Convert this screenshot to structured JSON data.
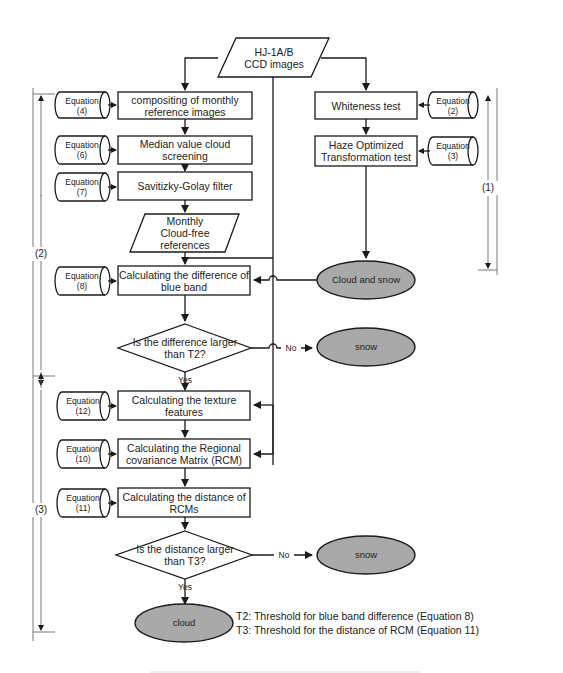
{
  "diagram": {
    "input": {
      "line1": "HJ-1A/B",
      "line2": "CCD images"
    },
    "left_steps": [
      {
        "label": "compositing of monthly reference images",
        "equation": "Equation",
        "eq_num": "(4)"
      },
      {
        "label": "Median value cloud screening",
        "equation": "Equation",
        "eq_num": "(6)"
      },
      {
        "label": "Savitizky-Golay filter",
        "equation": "Equation",
        "eq_num": "(7)"
      }
    ],
    "references": {
      "line1": "Monthly",
      "line2": "Cloud-free",
      "line3": "references"
    },
    "right_steps": [
      {
        "label": "Whiteness test",
        "equation": "Equation",
        "eq_num": "(2)"
      },
      {
        "label1": "Haze Optimized",
        "label2": "Transformation test",
        "equation": "Equation",
        "eq_num": "(3)"
      }
    ],
    "cloud_and_snow": "Cloud and snow",
    "blue_band": {
      "label1": "Calculating the difference of",
      "label2": "blue band",
      "equation": "Equation",
      "eq_num": "(8)"
    },
    "decision1": {
      "line1": "Is the difference larger",
      "line2": "than T2?",
      "no": "No",
      "yes": "Yes"
    },
    "snow1": "snow",
    "texture": {
      "label1": "Calculating the texture",
      "label2": "features",
      "equation": "Equation",
      "eq_num": "(12)"
    },
    "rcm": {
      "label1": "Calculating the Regional",
      "label2": "covariance Matrix (RCM)",
      "equation": "Equation",
      "eq_num": "(10)"
    },
    "distance": {
      "label1": "Calculating the distance of",
      "label2": "RCMs",
      "equation": "Equation",
      "eq_num": "(11)"
    },
    "decision2": {
      "line1": "Is the distance larger",
      "line2": "than T3?",
      "no": "No",
      "yes": "Yes"
    },
    "snow2": "snow",
    "cloud": "cloud",
    "notes": [
      "T2: Threshold for blue band difference (Equation 8)",
      "T3: Threshold for the distance of RCM (Equation 11)"
    ],
    "brackets": {
      "one": "(1)",
      "two": "(2)",
      "three": "(3)"
    },
    "colors": {
      "terminal_fill": "#a9a9a9",
      "line": "#1a1a1a"
    }
  }
}
